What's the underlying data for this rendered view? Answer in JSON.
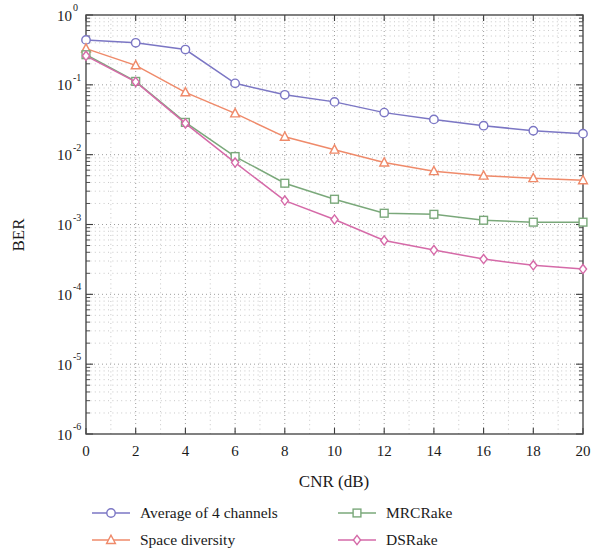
{
  "chart_data": {
    "type": "line",
    "title": "",
    "xlabel": "CNR (dB)",
    "ylabel": "BER",
    "xlim": [
      0,
      20
    ],
    "ylim": [
      1e-06,
      1
    ],
    "yscale": "log",
    "xscale": "linear",
    "grid": true,
    "grid_style": "dotted",
    "legend_position": "below-plot",
    "xticks": [
      "0",
      "2",
      "4",
      "6",
      "8",
      "10",
      "12",
      "14",
      "16",
      "18",
      "20"
    ],
    "xtick_values": [
      0,
      2,
      4,
      6,
      8,
      10,
      12,
      14,
      16,
      18,
      20
    ],
    "yticks": [
      "10^0",
      "10^-1",
      "10^-2",
      "10^-3",
      "10^-4",
      "10^-5",
      "10^-6"
    ],
    "ytick_exponents": [
      "0",
      "-1",
      "-2",
      "-3",
      "-4",
      "-5",
      "-6"
    ],
    "ytick_base": "10",
    "ytick_values": [
      1,
      0.1,
      0.01,
      0.001,
      0.0001,
      1e-05,
      1e-06
    ],
    "x": [
      0,
      2,
      4,
      6,
      8,
      10,
      12,
      14,
      16,
      18,
      20
    ],
    "series": [
      {
        "name": "Average of 4 channels",
        "color": "#7b76c4",
        "marker": "circle",
        "values": [
          0.44,
          0.4,
          0.32,
          0.105,
          0.072,
          0.057,
          0.04,
          0.032,
          0.026,
          0.022,
          0.02
        ]
      },
      {
        "name": "Space diversity",
        "color": "#ef8a6a",
        "marker": "triangle",
        "values": [
          0.33,
          0.19,
          0.078,
          0.039,
          0.018,
          0.0118,
          0.0077,
          0.0058,
          0.005,
          0.0046,
          0.0043
        ]
      },
      {
        "name": "MRCRake",
        "color": "#7aa87a",
        "marker": "square",
        "values": [
          0.27,
          0.112,
          0.029,
          0.0094,
          0.0039,
          0.0023,
          0.00145,
          0.0014,
          0.00115,
          0.00108,
          0.00108
        ]
      },
      {
        "name": "DSRake",
        "color": "#d56aa8",
        "marker": "diamond",
        "values": [
          0.26,
          0.11,
          0.028,
          0.0077,
          0.0022,
          0.00118,
          0.00059,
          0.00043,
          0.00032,
          0.00026,
          0.00023
        ]
      }
    ]
  },
  "legend": {
    "entries": [
      {
        "label": "Average of 4 channels"
      },
      {
        "label": "MRCRake"
      },
      {
        "label": "Space diversity"
      },
      {
        "label": "DSRake"
      }
    ]
  }
}
